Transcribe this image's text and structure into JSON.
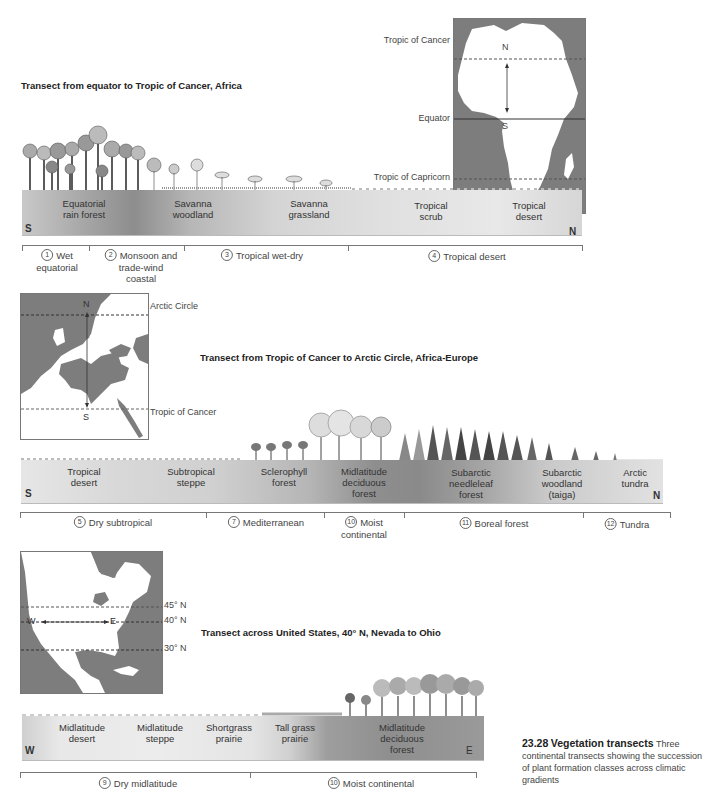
{
  "figure": {
    "number": "23.28",
    "title": "Vegetation transects",
    "caption_text": "Three continental transects showing the succession of plant formation classes across climatic gradients"
  },
  "colors": {
    "map_water": "#7d7d7d",
    "map_land": "#ffffff",
    "bar_light": "#e8e8e8",
    "bar_dark": "#8a8a8a",
    "band_line": "#777777"
  },
  "transects": [
    {
      "title": "Transect from equator to Tropic of Cancer, Africa",
      "map": {
        "region": "Africa",
        "lines": [
          "Tropic of Cancer",
          "Equator",
          "Tropic of Capricorn"
        ],
        "arrow_start": "N",
        "arrow_end": "S"
      },
      "ends": {
        "left": "S",
        "right": "N"
      },
      "formations": [
        {
          "label": "Equatorial\nrain forest",
          "line1": "Equatorial",
          "line2": "rain forest"
        },
        {
          "label": "Savanna woodland",
          "line1": "Savanna",
          "line2": "woodland"
        },
        {
          "label": "Savanna grassland",
          "line1": "Savanna",
          "line2": "grassland"
        },
        {
          "label": "Tropical scrub",
          "line1": "Tropical",
          "line2": "scrub"
        },
        {
          "label": "Tropical desert",
          "line1": "Tropical",
          "line2": "desert"
        }
      ],
      "climates": [
        {
          "num": "1",
          "line1": "Wet",
          "line2": "equatorial"
        },
        {
          "num": "2",
          "line1": "Monsoon and",
          "line2": "trade-wind",
          "line3": "coastal"
        },
        {
          "num": "3",
          "line1": "Tropical wet-dry"
        },
        {
          "num": "4",
          "line1": "Tropical desert"
        }
      ]
    },
    {
      "title": "Transect from Tropic of Cancer to Arctic Circle, Africa-Europe",
      "map": {
        "region": "Europe",
        "lines": [
          "Arctic Circle",
          "Tropic of Cancer"
        ],
        "arrow_start": "N",
        "arrow_end": "S"
      },
      "ends": {
        "left": "S",
        "right": "N"
      },
      "formations": [
        {
          "line1": "Tropical",
          "line2": "desert"
        },
        {
          "line1": "Subtropical",
          "line2": "steppe"
        },
        {
          "line1": "Sclerophyll",
          "line2": "forest"
        },
        {
          "line1": "Midlatitude",
          "line2": "deciduous",
          "line3": "forest"
        },
        {
          "line1": "Subarctic",
          "line2": "needleleaf",
          "line3": "forest"
        },
        {
          "line1": "Subarctic",
          "line2": "woodland",
          "line3": "(taiga)"
        },
        {
          "line1": "Arctic",
          "line2": "tundra"
        }
      ],
      "climates": [
        {
          "num": "5",
          "line1": "Dry subtropical"
        },
        {
          "num": "7",
          "line1": "Mediterranean"
        },
        {
          "num": "10",
          "line1": "Moist",
          "line2": "continental"
        },
        {
          "num": "11",
          "line1": "Boreal forest"
        },
        {
          "num": "12",
          "line1": "Tundra"
        }
      ]
    },
    {
      "title": "Transect across United States, 40° N, Nevada to Ohio",
      "map": {
        "region": "North America",
        "lines": [
          "45° N",
          "40° N",
          "30° N"
        ],
        "arrow_start": "W",
        "arrow_end": "E"
      },
      "ends": {
        "left": "W",
        "right": "E"
      },
      "formations": [
        {
          "line1": "Midlatitude",
          "line2": "desert"
        },
        {
          "line1": "Midlatitude",
          "line2": "steppe"
        },
        {
          "line1": "Shortgrass",
          "line2": "prairie"
        },
        {
          "line1": "Tall grass",
          "line2": "prairie"
        },
        {
          "line1": "Midlatitude",
          "line2": "deciduous",
          "line3": "forest"
        }
      ],
      "climates": [
        {
          "num": "9",
          "line1": "Dry midlatitude"
        },
        {
          "num": "10",
          "line1": "Moist continental"
        }
      ]
    }
  ]
}
